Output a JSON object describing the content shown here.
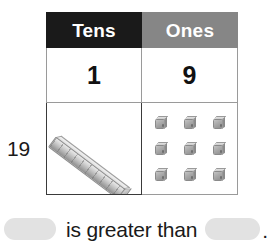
{
  "worksheet": {
    "row_label": "19"
  },
  "place_value_table": {
    "columns": [
      {
        "key": "tens",
        "header": "Tens",
        "header_bg": "#1a1a1a",
        "digit": "1"
      },
      {
        "key": "ones",
        "header": "Ones",
        "header_bg": "#868686",
        "digit": "9"
      }
    ],
    "manipulatives": {
      "tens_rod_count": 1,
      "tens_rod_units": 10,
      "ones_cube_count": 9,
      "ones_grid_rows": 3,
      "ones_grid_cols": 3
    }
  },
  "comparison_sentence": {
    "blank_left": "",
    "text": "is greater than",
    "blank_right": "",
    "period": ".",
    "blank_color": "#e2e2e2"
  }
}
